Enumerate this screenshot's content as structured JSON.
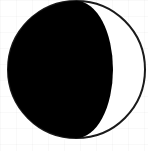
{
  "icon": {
    "name": "moon-phase",
    "phase": "waning-gibbous",
    "illuminated_side": "right",
    "colors": {
      "shadow": "#000000",
      "lit": "#ffffff",
      "outline": "#1a1a1a",
      "background": "#ffffff"
    },
    "geometry": {
      "cx": 76.5,
      "cy": 69.5,
      "r": 68.5,
      "terminator_rx": 36.5,
      "outline_width": 2
    }
  }
}
